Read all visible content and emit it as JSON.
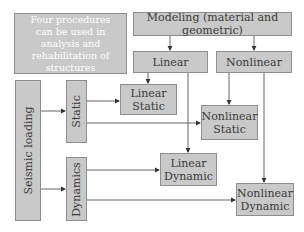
{
  "diagram": {
    "intro_note": "Four procedures can be used in analysis and rehabilitation of structures",
    "modeling": "Modeling (material and geometric)",
    "linear": "Linear",
    "nonlinear": "Nonlinear",
    "seismic_loading": "Seismic loading",
    "static": "Static",
    "dynamics": "Dynamics",
    "linear_static": "Linear Static",
    "nonlinear_static": "Nonlinear Static",
    "linear_dynamic": "Linear Dynamic",
    "nonlinear_dynamic": "Nonlinear Dynamic"
  },
  "colors": {
    "box_fill": "#c9c9c9",
    "box_border": "#8e8e8e",
    "line": "#555555",
    "intro_text": "#ffffff"
  }
}
